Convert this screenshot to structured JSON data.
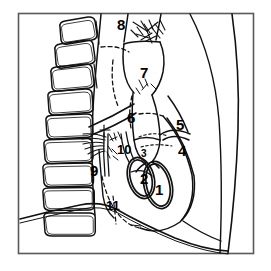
{
  "figure": {
    "kind": "anatomical-line-drawing",
    "view": "lateral chest radiograph schematic",
    "frame_color": "#595959",
    "ink_color": "#111111",
    "background_color": "#ffffff"
  },
  "labels": [
    {
      "id": "label-1",
      "text": "1",
      "x": 155,
      "y": 182,
      "size": "lg"
    },
    {
      "id": "label-2",
      "text": "2",
      "x": 140,
      "y": 171,
      "size": "lg"
    },
    {
      "id": "label-3",
      "text": "3",
      "x": 141,
      "y": 149,
      "size": "sm"
    },
    {
      "id": "label-4",
      "text": "4",
      "x": 178,
      "y": 143,
      "size": "lg"
    },
    {
      "id": "label-5",
      "text": "5",
      "x": 176,
      "y": 117,
      "size": "lg"
    },
    {
      "id": "label-6",
      "text": "6",
      "x": 127,
      "y": 110,
      "size": "lg"
    },
    {
      "id": "label-7",
      "text": "7",
      "x": 140,
      "y": 65,
      "size": "lg"
    },
    {
      "id": "label-8",
      "text": "8",
      "x": 117,
      "y": 17,
      "size": "lg"
    },
    {
      "id": "label-9",
      "text": "9",
      "x": 90,
      "y": 163,
      "size": "lg"
    },
    {
      "id": "label-10",
      "text": "10",
      "x": 117,
      "y": 143,
      "size": "md"
    },
    {
      "id": "label-11",
      "text": "11",
      "x": 106,
      "y": 199,
      "size": "md"
    }
  ],
  "structures": [
    {
      "name": "vertebral-bodies",
      "count": 9
    },
    {
      "name": "posterior-chest-wall"
    },
    {
      "name": "anterior-chest-wall"
    },
    {
      "name": "sternum-line"
    },
    {
      "name": "trachea"
    },
    {
      "name": "aortic-arch"
    },
    {
      "name": "descending-aorta"
    },
    {
      "name": "left-atrium"
    },
    {
      "name": "heart-border"
    },
    {
      "name": "mitral-valve-ring"
    },
    {
      "name": "aortic-valve-ring"
    },
    {
      "name": "hilar-vessels"
    },
    {
      "name": "pulmonary-artery-branches"
    },
    {
      "name": "diaphragm"
    },
    {
      "name": "retrocardiac-space"
    }
  ]
}
